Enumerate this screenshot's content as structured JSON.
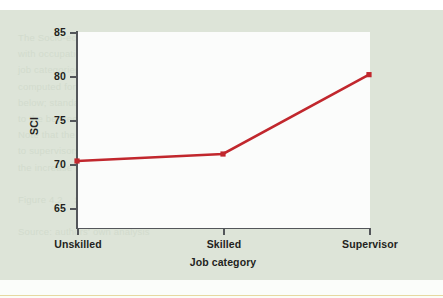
{
  "figure": {
    "background_color": "#dde4d8",
    "plot_background_color": "#fbfcfb",
    "axis_color": "#53565a",
    "ghost_text": "The Socio-economic Index (SCI) scores rose\nwith occupational standing across the three\njob categories sampled. Mean values were\ncomputed for each grouping and plotted\nbelow; standard errors were small relative\nto the between-group differences observed.\nNote that the increase from skilled workers\nto supervisors is considerably larger than\nthe increase from unskilled to skilled.\n\nFigure 4.2    SCI by job category\n\nSource: authors' own analysis"
  },
  "chart_data": {
    "type": "line",
    "title": "",
    "xlabel": "Job category",
    "ylabel": "SCI",
    "categories": [
      "Unskilled",
      "Skilled",
      "Supervisor"
    ],
    "values": [
      70.4,
      71.2,
      80.3
    ],
    "series": [
      {
        "name": "SCI",
        "color": "#c1272d",
        "marker": "square",
        "values": [
          70.4,
          71.2,
          80.3
        ]
      }
    ],
    "ylim": [
      64.0,
      86.2
    ],
    "yticks": [
      65,
      70,
      75,
      80,
      85
    ],
    "ytick_labels": [
      "65",
      "70",
      "75",
      "80",
      "85"
    ],
    "xtick_labels": [
      "Unskilled",
      "Skilled",
      "Supervisor"
    ],
    "grid": false,
    "legend": false,
    "legend_position": "none"
  }
}
